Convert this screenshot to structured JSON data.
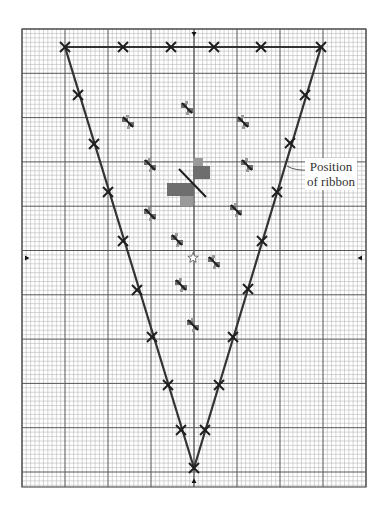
{
  "annotation": {
    "line1": "Position",
    "line2": "of ribbon"
  },
  "colors": {
    "minor_grid": "#b8b8b8",
    "major_grid": "#555555",
    "outline": "#333333",
    "motif_dark": "#6e6e6e",
    "motif_light": "#9a9a9a",
    "stroke": "#1e1e1e"
  },
  "grid": {
    "left": 22,
    "top": 29,
    "right": 366,
    "bottom": 487,
    "minor_step_x": 4.3,
    "minor_step_y": 4.43,
    "major_every": 10
  },
  "center_arrows": [
    {
      "name": "top-center-arrow",
      "x": 194,
      "y": 34,
      "dir": "down"
    },
    {
      "name": "bottom-center-arrow",
      "x": 194,
      "y": 481,
      "dir": "up"
    },
    {
      "name": "left-center-arrow",
      "x": 27,
      "y": 258,
      "dir": "right"
    },
    {
      "name": "right-center-arrow",
      "x": 360,
      "y": 258,
      "dir": "left"
    }
  ],
  "outline_markers": [
    [
      65,
      47
    ],
    [
      123,
      47
    ],
    [
      171,
      47
    ],
    [
      214,
      47
    ],
    [
      261,
      47
    ],
    [
      321,
      47
    ],
    [
      78,
      95
    ],
    [
      94,
      144
    ],
    [
      108,
      192
    ],
    [
      123,
      241
    ],
    [
      137,
      290
    ],
    [
      152,
      337
    ],
    [
      168,
      385
    ],
    [
      181,
      430
    ],
    [
      194,
      468
    ],
    [
      305,
      95
    ],
    [
      290,
      143
    ],
    [
      277,
      192
    ],
    [
      262,
      241
    ],
    [
      248,
      289
    ],
    [
      233,
      337
    ],
    [
      219,
      385
    ],
    [
      205,
      430
    ]
  ],
  "outline_path": [
    [
      65,
      47
    ],
    [
      321,
      47
    ],
    [
      194,
      468
    ]
  ],
  "small_bows": [
    [
      128,
      122
    ],
    [
      187,
      108
    ],
    [
      243,
      122
    ],
    [
      150,
      165
    ],
    [
      247,
      165
    ],
    [
      150,
      214
    ],
    [
      236,
      210
    ],
    [
      177,
      240
    ],
    [
      214,
      262
    ],
    [
      181,
      285
    ],
    [
      193,
      325
    ]
  ],
  "central_bow": {
    "blocks": [
      {
        "x": 193,
        "y": 158,
        "w": 10,
        "h": 8,
        "tone": "light"
      },
      {
        "x": 193,
        "y": 166,
        "w": 17,
        "h": 13,
        "tone": "dark"
      },
      {
        "x": 167,
        "y": 183,
        "w": 27,
        "h": 13,
        "tone": "dark"
      },
      {
        "x": 180,
        "y": 196,
        "w": 13,
        "h": 10,
        "tone": "light"
      }
    ],
    "line": [
      179,
      169,
      206,
      197
    ]
  },
  "star": {
    "x": 193,
    "y": 258
  },
  "leader": {
    "from": [
      287,
      166
    ],
    "to": [
      309,
      170
    ]
  }
}
